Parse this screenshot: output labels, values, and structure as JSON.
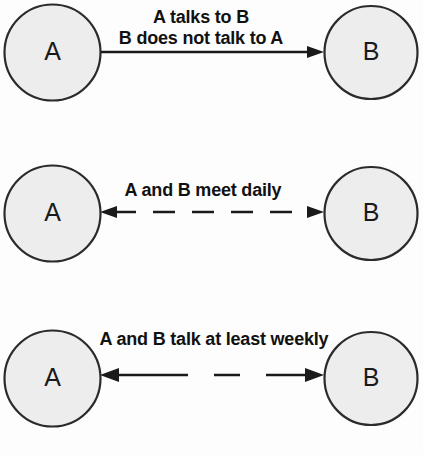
{
  "diagram": {
    "colors": {
      "node_fill": "#ededed",
      "node_stroke": "#2b2b2b",
      "edge": "#1a1a1a",
      "label_text": "#111111",
      "background": "#fdfdfd"
    },
    "panels": [
      {
        "id": "panel-one-way",
        "direction": "one-way",
        "line_style": "solid",
        "source": {
          "label": "A"
        },
        "target": {
          "label": "B"
        },
        "label_lines": [
          "A talks to B",
          "B does not talk to A"
        ]
      },
      {
        "id": "panel-daily",
        "direction": "two-way",
        "line_style": "dashed",
        "source": {
          "label": "A"
        },
        "target": {
          "label": "B"
        },
        "label_lines": [
          "A and B meet daily"
        ]
      },
      {
        "id": "panel-weekly",
        "direction": "two-way",
        "line_style": "long-dashed",
        "source": {
          "label": "A"
        },
        "target": {
          "label": "B"
        },
        "label_lines": [
          "A and B talk at least weekly"
        ]
      }
    ]
  }
}
